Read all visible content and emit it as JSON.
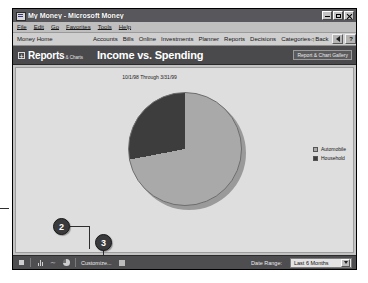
{
  "window": {
    "title": "My Money - Microsoft Money",
    "icon": "money-app-icon",
    "buttons": {
      "minimize": "minimize-button",
      "maximize": "maximize-button",
      "close": "close-button"
    }
  },
  "menubar": {
    "items": [
      "File",
      "Edit",
      "Go",
      "Favorites",
      "Tools",
      "Help"
    ]
  },
  "navbar": {
    "home": "Money Home",
    "links": [
      "Accounts",
      "Bills",
      "Online",
      "Investments",
      "Planner",
      "Reports",
      "Decisions",
      "Categories"
    ],
    "back": "Back",
    "sound_icon": "speaker-icon",
    "help": "?"
  },
  "header": {
    "section": "Reports",
    "section_sub": "& Charts",
    "expand_icon": "plus-box-icon",
    "title": "Income vs. Spending",
    "gallery_button": "Report & Chart Gallery"
  },
  "chart_data": {
    "type": "pie",
    "title": "Income vs. Spending",
    "subtitle": "10/1/98 Through 3/31/99",
    "categories": [
      "Automobile",
      "Household"
    ],
    "values": [
      72,
      28
    ],
    "colors": [
      "#a9a9a9",
      "#3d3d3d"
    ],
    "legend_position": "right",
    "start_angle_deg": 0,
    "grid": false,
    "xlabel": "",
    "ylabel": ""
  },
  "toolbar": {
    "icons": [
      "stop-icon",
      "bar-chart-icon",
      "line-chart-icon",
      "pie-chart-icon"
    ],
    "customize": "Customize...",
    "customize_icon": "customize-icon",
    "date_range_label": "Date Range:",
    "date_range_value": "Last 6 Months",
    "date_range_options": [
      "Last 6 Months"
    ]
  },
  "callouts": [
    {
      "number": "2"
    },
    {
      "number": "3"
    }
  ]
}
